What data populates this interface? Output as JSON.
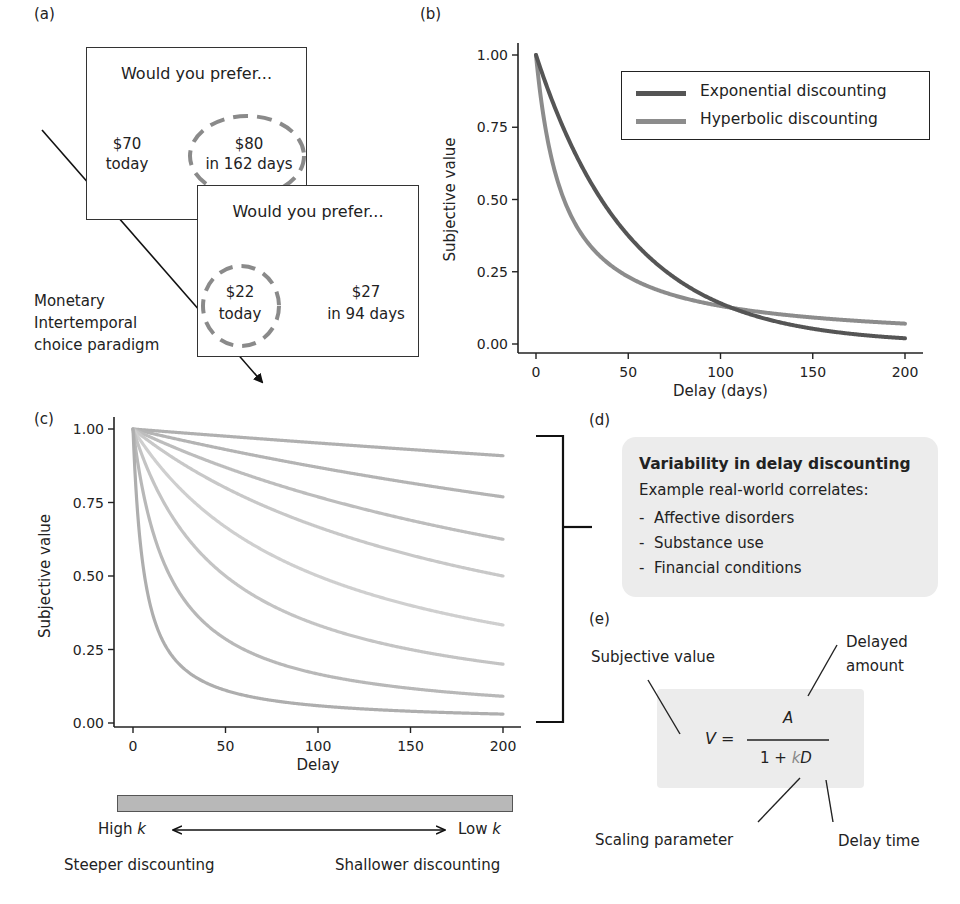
{
  "panels": {
    "a": {
      "label": "(a)",
      "paradigm_label": [
        "Monetary",
        "Intertemporal",
        "choice paradigm"
      ],
      "trial1": {
        "question": "Would you prefer...",
        "option_left": {
          "amount": "$70",
          "when": "today",
          "chosen": false
        },
        "option_right": {
          "amount": "$80",
          "when": "in 162 days",
          "chosen": true
        }
      },
      "trial2": {
        "question": "Would you prefer...",
        "option_left": {
          "amount": "$22",
          "when": "today",
          "chosen": true
        },
        "option_right": {
          "amount": "$27",
          "when": "in 94 days",
          "chosen": false
        }
      }
    },
    "b": {
      "label": "(b)"
    },
    "c": {
      "label": "(c)"
    },
    "d": {
      "label": "(d)",
      "title": "Variability in delay discounting",
      "subtitle": "Example real-world correlates:",
      "items": [
        "Affective disorders",
        "Substance use",
        "Financial conditions"
      ],
      "bullet": "-"
    },
    "e": {
      "label": "(e)",
      "formula": {
        "lhs": "V",
        "equals": "=",
        "numerator": "A",
        "denominator_prefix": "1 +",
        "k": "k",
        "D": "D"
      },
      "annotations": {
        "subjective_value": "Subjective value",
        "delayed_amount_1": "Delayed",
        "delayed_amount_2": "amount",
        "scaling_parameter": "Scaling parameter",
        "delay_time": "Delay time"
      }
    },
    "k_scale": {
      "high_label": "High ",
      "low_label": "Low ",
      "k": "k",
      "steeper": "Steeper discounting",
      "shallower": "Shallower discounting"
    }
  },
  "colors": {
    "exponential": "#555555",
    "hyperbolic": "#8c8c8c",
    "family": "#b4b4b4",
    "dashed_circle": "#8a8a8a",
    "shade": "#ececec",
    "bar": "#b8b8b8"
  },
  "chart_data": [
    {
      "id": "b",
      "type": "line",
      "title": "",
      "xlabel": "Delay (days)",
      "ylabel": "Subjective value",
      "xlim": [
        0,
        200
      ],
      "ylim": [
        0,
        1
      ],
      "xticks": [
        0,
        50,
        100,
        150,
        200
      ],
      "yticks": [
        "0.00",
        "0.25",
        "0.50",
        "0.75",
        "1.00"
      ],
      "legend_position": "upper right",
      "grid": false,
      "series": [
        {
          "name": "Exponential discounting",
          "model": "exponential",
          "k": 0.0196,
          "x": [
            0,
            25,
            50,
            75,
            100,
            125,
            150,
            175,
            200
          ],
          "values": [
            1.0,
            0.61,
            0.38,
            0.23,
            0.14,
            0.09,
            0.05,
            0.03,
            0.02
          ]
        },
        {
          "name": "Hyperbolic discounting",
          "model": "hyperbolic",
          "k": 0.066,
          "x": [
            0,
            25,
            50,
            75,
            100,
            125,
            150,
            175,
            200
          ],
          "values": [
            1.0,
            0.38,
            0.23,
            0.17,
            0.13,
            0.11,
            0.09,
            0.08,
            0.07
          ]
        }
      ]
    },
    {
      "id": "c",
      "type": "line",
      "title": "",
      "xlabel": "Delay",
      "ylabel": "Subjective value",
      "xlim": [
        0,
        200
      ],
      "ylim": [
        0,
        1
      ],
      "xticks": [
        0,
        50,
        100,
        150,
        200
      ],
      "yticks": [
        "0.00",
        "0.25",
        "0.50",
        "0.75",
        "1.00"
      ],
      "grid": false,
      "series": [
        {
          "name": "k=0.0005",
          "model": "hyperbolic",
          "k": 0.0005,
          "end_value": 0.91
        },
        {
          "name": "k=0.0015",
          "model": "hyperbolic",
          "k": 0.0015,
          "end_value": 0.77
        },
        {
          "name": "k=0.003",
          "model": "hyperbolic",
          "k": 0.003,
          "end_value": 0.62
        },
        {
          "name": "k=0.005",
          "model": "hyperbolic",
          "k": 0.005,
          "end_value": 0.5
        },
        {
          "name": "k=0.01",
          "model": "hyperbolic",
          "k": 0.01,
          "end_value": 0.33
        },
        {
          "name": "k=0.02",
          "model": "hyperbolic",
          "k": 0.02,
          "end_value": 0.2
        },
        {
          "name": "k=0.05",
          "model": "hyperbolic",
          "k": 0.05,
          "end_value": 0.09
        },
        {
          "name": "k=0.16",
          "model": "hyperbolic",
          "k": 0.16,
          "end_value": 0.03
        }
      ]
    }
  ]
}
